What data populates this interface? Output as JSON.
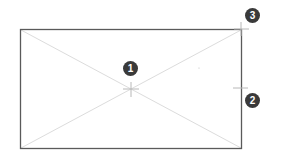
{
  "diagram": {
    "type": "rectangle-placeholder",
    "rect": {
      "x": 20,
      "y": 29,
      "width": 222,
      "height": 120,
      "stroke": "#555555"
    },
    "diagonal_color": "#d8d8d8",
    "crosshair_color": "#bdbdbd",
    "callouts": [
      {
        "label": "1",
        "x": 123,
        "y": 61,
        "target": {
          "x": 131,
          "y": 89
        },
        "meaning": "center point"
      },
      {
        "label": "2",
        "x": 245,
        "y": 93,
        "target": {
          "x": 240,
          "y": 88
        },
        "meaning": "right edge midpoint"
      },
      {
        "label": "3",
        "x": 245,
        "y": 8,
        "target": {
          "x": 241,
          "y": 29
        },
        "meaning": "top-right corner"
      }
    ],
    "callout_color": "#3a3a3a"
  }
}
